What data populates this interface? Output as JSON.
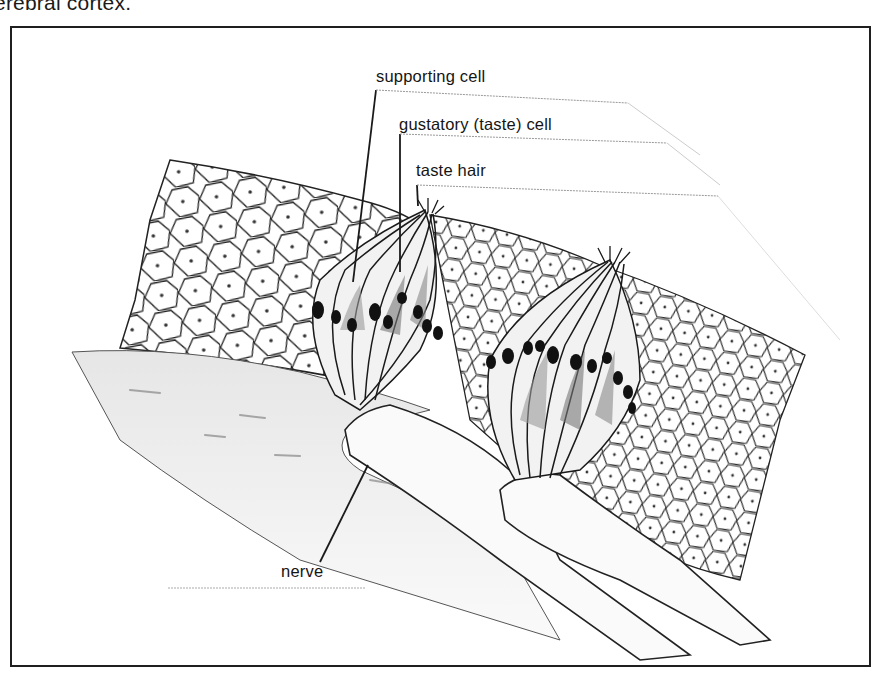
{
  "caption": {
    "text": "erebral cortex."
  },
  "figure": {
    "labels": [
      {
        "id": "supporting-cell",
        "text": "supporting cell"
      },
      {
        "id": "gustatory-cell",
        "text": "gustatory (taste) cell"
      },
      {
        "id": "taste-hair",
        "text": "taste hair"
      },
      {
        "id": "nerve",
        "text": "nerve"
      }
    ]
  },
  "colors": {
    "frame": "#1f1f1f",
    "ink": "#151515",
    "background": "#ffffff",
    "shading": "#9a9a9a"
  }
}
